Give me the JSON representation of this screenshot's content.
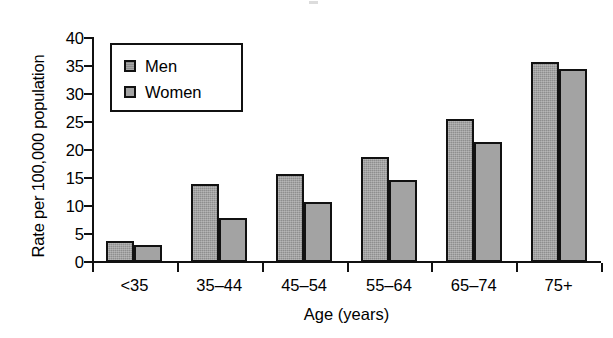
{
  "chart_data": {
    "type": "bar",
    "title": "",
    "xlabel": "Age (years)",
    "ylabel": "Rate per 100,000 population",
    "categories": [
      "<35",
      "35–44",
      "45–54",
      "55–64",
      "65–74",
      "75+"
    ],
    "series": [
      {
        "name": "Men",
        "color": "#8e8e8e",
        "values": [
          3.8,
          14.0,
          15.8,
          18.8,
          25.6,
          35.8
        ]
      },
      {
        "name": "Women",
        "color": "#a3a3a3",
        "values": [
          3.0,
          7.8,
          10.7,
          14.6,
          21.5,
          34.5
        ]
      }
    ],
    "ylim": [
      0,
      40
    ],
    "ytick_values": [
      0,
      5,
      10,
      15,
      20,
      25,
      30,
      35,
      40
    ],
    "ytick_labels": [
      "0",
      "5",
      "10",
      "15",
      "20",
      "25",
      "30",
      "35",
      "40"
    ],
    "grid": false,
    "legend_position": "top-left",
    "axis_line_color": "#111111",
    "bar_edge_color": "#111111",
    "background_color": "#ffffff"
  },
  "legend": {
    "entries": [
      {
        "label": "Men",
        "swatch": "men-swatch"
      },
      {
        "label": "Women",
        "swatch": "women-swatch"
      }
    ]
  }
}
